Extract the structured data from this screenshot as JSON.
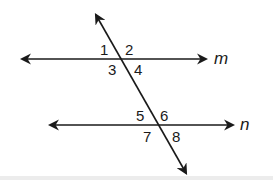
{
  "diagram": {
    "colors": {
      "stroke": "#1a1a1a",
      "background": "#ffffff"
    },
    "lines": {
      "m": {
        "label": "m",
        "y": 59,
        "x1": 20,
        "x2": 208
      },
      "n": {
        "label": "n",
        "y": 125,
        "x1": 48,
        "x2": 235
      },
      "transversal": {
        "x1": 95,
        "y1": 13,
        "x2": 187,
        "y2": 175
      }
    },
    "angles": [
      {
        "id": "1",
        "label": "1"
      },
      {
        "id": "2",
        "label": "2"
      },
      {
        "id": "3",
        "label": "3"
      },
      {
        "id": "4",
        "label": "4"
      },
      {
        "id": "5",
        "label": "5"
      },
      {
        "id": "6",
        "label": "6"
      },
      {
        "id": "7",
        "label": "7"
      },
      {
        "id": "8",
        "label": "8"
      }
    ]
  }
}
